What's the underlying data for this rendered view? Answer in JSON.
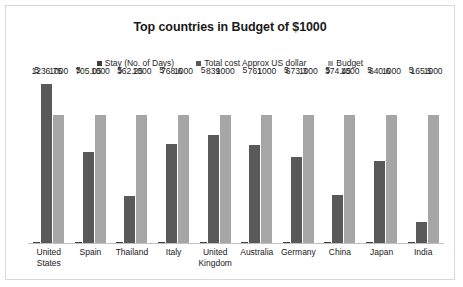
{
  "chart": {
    "title": "Top countries in Budget of $1000"
  },
  "legend": {
    "items": [
      {
        "label": "Stay (No. of Days)",
        "color": "#404040",
        "key": "stay"
      },
      {
        "label": "Total cost Approx US dollar",
        "color": "#595959",
        "key": "cost"
      },
      {
        "label": "Budget",
        "color": "#a6a6a6",
        "key": "budget"
      }
    ]
  },
  "chart_data": {
    "type": "bar",
    "title": "Top countries in Budget of $1000",
    "xlabel": "",
    "ylabel": "",
    "ylim": [
      0,
      1300
    ],
    "grid": false,
    "axis_labels_visible": false,
    "legend_position": "top",
    "categories": [
      "United States",
      "Spain",
      "Thailand",
      "Italy",
      "United Kingdom",
      "Australia",
      "Germany",
      "China",
      "Japan",
      "India"
    ],
    "series": [
      {
        "name": "Stay (No. of Days)",
        "color": "#404040",
        "values": [
          5,
          5,
          5,
          5,
          5,
          5,
          5,
          5,
          5,
          5
        ],
        "labels": [
          "5",
          "5",
          "5",
          "5",
          "5",
          "5",
          "5",
          "5",
          "5",
          "5"
        ]
      },
      {
        "name": "Total cost Approx US dollar",
        "color": "#595959",
        "values": [
          1236.75,
          705.05,
          362.25,
          768.6,
          839,
          761,
          673.3,
          374.45,
          640.6,
          165.5
        ],
        "labels": [
          "1236.75",
          "705.05",
          "362.25",
          "768.6",
          "839",
          "761",
          "673.3",
          "374.45",
          "640.6",
          "165.5"
        ]
      },
      {
        "name": "Budget",
        "color": "#a6a6a6",
        "values": [
          1000,
          1000,
          1000,
          1000,
          1000,
          1000,
          1000,
          1000,
          1000,
          1000
        ],
        "labels": [
          "1000",
          "1000",
          "1000",
          "1000",
          "1000",
          "1000",
          "1000",
          "1000",
          "1000",
          "1000"
        ]
      }
    ]
  }
}
